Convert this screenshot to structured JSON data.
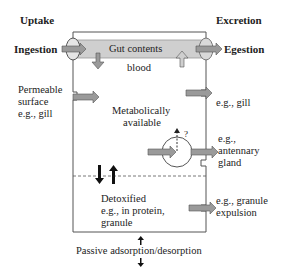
{
  "headers": {
    "uptake": "Uptake",
    "excretion": "Excretion"
  },
  "labels": {
    "ingestion": "Ingestion",
    "egestion": "Egestion",
    "gut_contents": "Gut contents",
    "blood": "blood",
    "permeable_1": "Permeable",
    "permeable_2": "surface",
    "permeable_3": "e.g., gill",
    "excr_gill": "e.g., gill",
    "metab_1": "Metabolically",
    "metab_2": "available",
    "question": "?",
    "antennary_1": "e.g.,",
    "antennary_2": "antennary",
    "antennary_3": "gland",
    "detox_1": "Detoxified",
    "detox_2": "e.g., in protein,",
    "detox_3": "granule",
    "granule_1": "e.g., granule",
    "granule_2": "expulsion",
    "passive": "Passive adsorption/desorption"
  },
  "colors": {
    "arrow_fill": "#9a9a9a",
    "gut_fill": "#cfcfcf",
    "line": "#555555"
  }
}
